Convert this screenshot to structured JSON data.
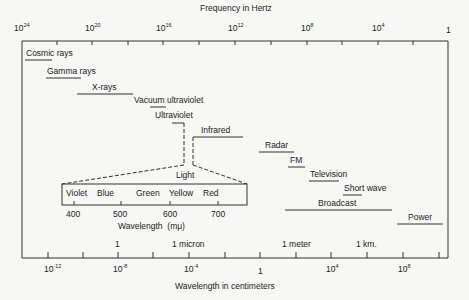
{
  "frequency_axis": {
    "title": "Frequency in Hertz",
    "ticks": [
      {
        "base": "10",
        "exp": "24",
        "x": 22
      },
      {
        "base": "10",
        "exp": "20",
        "x": 92
      },
      {
        "base": "10",
        "exp": "16",
        "x": 163
      },
      {
        "base": "10",
        "exp": "12",
        "x": 235
      },
      {
        "base": "10",
        "exp": "8",
        "x": 307
      },
      {
        "base": "10",
        "exp": "4",
        "x": 378
      },
      {
        "base": "1",
        "exp": "",
        "x": 449
      }
    ]
  },
  "bands": [
    {
      "label": "Cosmic rays",
      "x1": 25,
      "x2": 52,
      "y": 60
    },
    {
      "label": "Gamma rays",
      "x1": 46,
      "x2": 81,
      "y": 78
    },
    {
      "label": "X-rays",
      "x1": 77,
      "x2": 133,
      "y": 94
    },
    {
      "label": "Vacuum ultraviolet",
      "x1": 150,
      "x2": 166,
      "y": 107
    },
    {
      "label": "Ultraviolet",
      "x1": 172,
      "x2": 184,
      "y": 123
    },
    {
      "label": "Infrared",
      "x1": 193,
      "x2": 243,
      "y": 137
    },
    {
      "label": "Radar",
      "x1": 259,
      "x2": 294,
      "y": 152
    },
    {
      "label": "FM",
      "x1": 288,
      "x2": 305,
      "y": 167
    },
    {
      "label": "Television",
      "x1": 309,
      "x2": 339,
      "y": 181
    },
    {
      "label": "Short wave",
      "x1": 343,
      "x2": 362,
      "y": 195
    },
    {
      "label": "Broadcast",
      "x1": 285,
      "x2": 392,
      "y": 210
    },
    {
      "label": "Power",
      "x1": 397,
      "x2": 443,
      "y": 224
    }
  ],
  "visible_light": {
    "title": "Light",
    "colors": [
      "Violet",
      "Blue",
      "Green",
      "Yellow",
      "Red"
    ],
    "ticks": [
      "400",
      "500",
      "600",
      "700"
    ],
    "axis_label": "Wavelength",
    "axis_unit": "(mμ)"
  },
  "wavelength_markers": [
    {
      "label": "1",
      "x": 117
    },
    {
      "label": "1 micron",
      "x": 190
    },
    {
      "label": "1 meter",
      "x": 296
    },
    {
      "label": "1 km.",
      "x": 368
    }
  ],
  "wavelength_axis": {
    "title": "Wavelength in centimeters",
    "ticks": [
      {
        "base": "10",
        "exp": "-12",
        "x": 50
      },
      {
        "base": "10",
        "exp": "-8",
        "x": 119
      },
      {
        "base": "10",
        "exp": "-4",
        "x": 190
      },
      {
        "base": "1",
        "exp": "",
        "x": 260
      },
      {
        "base": "10",
        "exp": "4",
        "x": 331
      },
      {
        "base": "10",
        "exp": "8",
        "x": 403
      }
    ]
  }
}
